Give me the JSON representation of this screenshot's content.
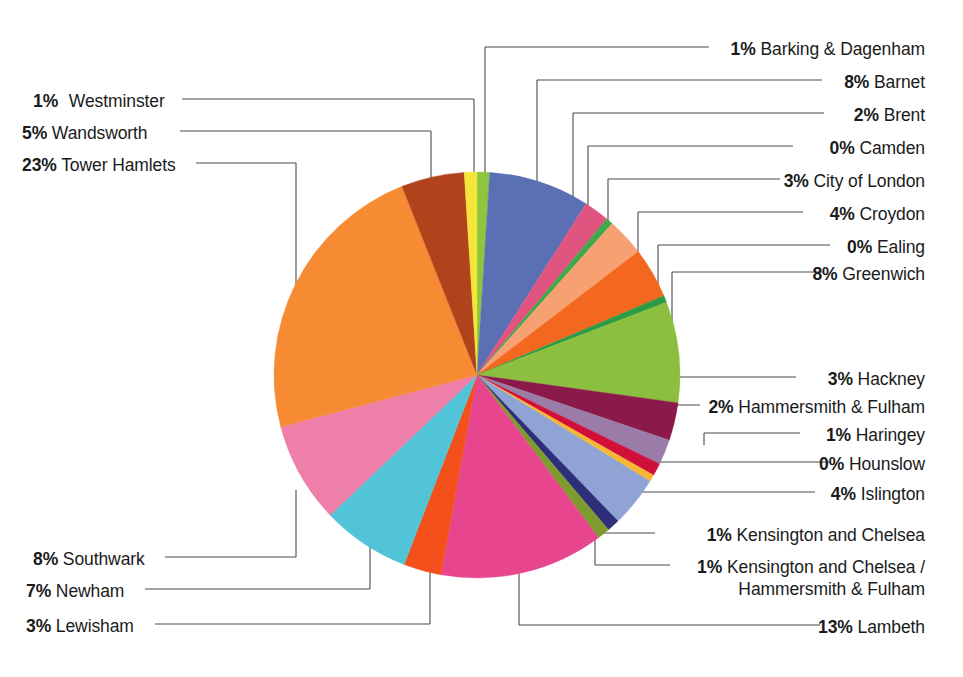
{
  "chart_data": {
    "type": "pie",
    "title": "",
    "subtitle": "",
    "xlabel": "",
    "ylabel": "",
    "legend_position": "callout-labels",
    "grid": false,
    "unit": "%",
    "total_shown": 100,
    "categories": [
      "Barking & Dagenham",
      "Barnet",
      "Brent",
      "Camden",
      "City of London",
      "Croydon",
      "Ealing",
      "Greenwich",
      "Hackney",
      "Hammersmith & Fulham",
      "Haringey",
      "Hounslow",
      "Islington",
      "Kensington and Chelsea",
      "Kensington and Chelsea / Hammersmith & Fulham",
      "Lambeth",
      "Lewisham",
      "Newham",
      "Southwark",
      "Tower Hamlets",
      "Wandsworth",
      "Westminster"
    ],
    "values": [
      1,
      8,
      2,
      0,
      3,
      4,
      0,
      8,
      3,
      2,
      1,
      0,
      4,
      1,
      1,
      13,
      3,
      7,
      8,
      23,
      5,
      1
    ],
    "colors": [
      "#8CC63F",
      "#5B6FB5",
      "#E0557F",
      "#3FA94A",
      "#F7A173",
      "#F4671F",
      "#2E9B45",
      "#8CBF3F",
      "#8B1A4A",
      "#9B7BA8",
      "#D0103A",
      "#F7B733",
      "#8FA4D4",
      "#2E2E7A",
      "#7E9B2E",
      "#E8458F",
      "#F4501B",
      "#52C4D8",
      "#EE7FA8",
      "#F68B33",
      "#B0431C",
      "#F5E53A"
    ],
    "slices": [
      {
        "label": "Barking & Dagenham",
        "pct_text": "1%",
        "value": 1,
        "color": "#8CC63F"
      },
      {
        "label": "Barnet",
        "pct_text": "8%",
        "value": 8,
        "color": "#5B6FB5"
      },
      {
        "label": "Brent",
        "pct_text": "2%",
        "value": 2,
        "color": "#E0557F"
      },
      {
        "label": "Camden",
        "pct_text": "0%",
        "value": 0,
        "color": "#3FA94A"
      },
      {
        "label": "City of London",
        "pct_text": "3%",
        "value": 3,
        "color": "#F7A173"
      },
      {
        "label": "Croydon",
        "pct_text": "4%",
        "value": 4,
        "color": "#F4671F"
      },
      {
        "label": "Ealing",
        "pct_text": "0%",
        "value": 0,
        "color": "#2E9B45"
      },
      {
        "label": "Greenwich",
        "pct_text": "8%",
        "value": 8,
        "color": "#8CBF3F"
      },
      {
        "label": "Hackney",
        "pct_text": "3%",
        "value": 3,
        "color": "#8B1A4A"
      },
      {
        "label": "Hammersmith & Fulham",
        "pct_text": "2%",
        "value": 2,
        "color": "#9B7BA8"
      },
      {
        "label": "Haringey",
        "pct_text": "1%",
        "value": 1,
        "color": "#D0103A"
      },
      {
        "label": "Hounslow",
        "pct_text": "0%",
        "value": 0,
        "color": "#F7B733"
      },
      {
        "label": "Islington",
        "pct_text": "4%",
        "value": 4,
        "color": "#8FA4D4"
      },
      {
        "label": "Kensington and Chelsea",
        "pct_text": "1%",
        "value": 1,
        "color": "#2E2E7A"
      },
      {
        "label": "Kensington and Chelsea / Hammersmith & Fulham",
        "pct_text": "1%",
        "value": 1,
        "color": "#7E9B2E"
      },
      {
        "label": "Lambeth",
        "pct_text": "13%",
        "value": 13,
        "color": "#E8458F"
      },
      {
        "label": "Lewisham",
        "pct_text": "3%",
        "value": 3,
        "color": "#F4501B"
      },
      {
        "label": "Newham",
        "pct_text": "7%",
        "value": 7,
        "color": "#52C4D8"
      },
      {
        "label": "Southwark",
        "pct_text": "8%",
        "value": 8,
        "color": "#EE7FA8"
      },
      {
        "label": "Tower Hamlets",
        "pct_text": "23%",
        "value": 23,
        "color": "#F68B33"
      },
      {
        "label": "Wandsworth",
        "pct_text": "5%",
        "value": 5,
        "color": "#B0431C"
      },
      {
        "label": "Westminster",
        "pct_text": "1%",
        "value": 1,
        "color": "#F5E53A"
      }
    ]
  },
  "labels": {
    "right": [
      {
        "pct": "1%",
        "name": "Barking & Dagenham"
      },
      {
        "pct": "8%",
        "name": "Barnet"
      },
      {
        "pct": "2%",
        "name": "Brent"
      },
      {
        "pct": "0%",
        "name": "Camden"
      },
      {
        "pct": "3%",
        "name": "City of London"
      },
      {
        "pct": "4%",
        "name": "Croydon"
      },
      {
        "pct": "0%",
        "name": "Ealing"
      },
      {
        "pct": "8%",
        "name": "Greenwich"
      },
      {
        "pct": "3%",
        "name": "Hackney"
      },
      {
        "pct": "2%",
        "name": "Hammersmith & Fulham"
      },
      {
        "pct": "1%",
        "name": "Haringey"
      },
      {
        "pct": "0%",
        "name": "Hounslow"
      },
      {
        "pct": "4%",
        "name": "Islington"
      },
      {
        "pct": "1%",
        "name": "Kensington and Chelsea"
      },
      {
        "pct": "1%",
        "name": "Kensington and Chelsea / Hammersmith & Fulham"
      },
      {
        "pct": "13%",
        "name": "Lambeth"
      }
    ],
    "left": [
      {
        "pct": "1%",
        "name": "Westminster"
      },
      {
        "pct": "5%",
        "name": "Wandsworth"
      },
      {
        "pct": "23%",
        "name": "Tower Hamlets"
      },
      {
        "pct": "8%",
        "name": "Southwark"
      },
      {
        "pct": "7%",
        "name": "Newham"
      },
      {
        "pct": "3%",
        "name": "Lewisham"
      }
    ],
    "kc_hf_line1": "1% Kensington and Chelsea /",
    "kc_hf_line2": "Hammersmith & Fulham"
  }
}
